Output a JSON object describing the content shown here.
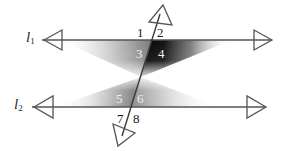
{
  "figure": {
    "background_color": "#ffffff",
    "stroke_color": "#555555",
    "width": 283,
    "height": 151
  },
  "lines": [
    {
      "id": "l1",
      "label": "l",
      "subscript": "1",
      "orientation": "horizontal",
      "y": 40,
      "x_start": 42,
      "x_end": 272,
      "arrow_left": true,
      "arrow_right": true
    },
    {
      "id": "l2",
      "label": "l",
      "subscript": "2",
      "orientation": "horizontal",
      "y": 107,
      "x_start": 32,
      "x_end": 266,
      "arrow_left": true,
      "arrow_right": true
    },
    {
      "id": "transversal",
      "label": "",
      "subscript": "",
      "orientation": "oblique",
      "x_top": 160,
      "y_top": 14,
      "x_bottom": 122,
      "y_bottom": 136,
      "arrow_top": true,
      "arrow_bottom": true
    }
  ],
  "intersections": [
    {
      "id": "top",
      "x": 152,
      "y": 40
    },
    {
      "id": "bottom",
      "x": 131,
      "y": 107
    }
  ],
  "angles": [
    {
      "number": "1",
      "x": 139,
      "y": 27,
      "tone": "light",
      "position": "upper-left-of-top-intersection"
    },
    {
      "number": "2",
      "x": 159,
      "y": 27,
      "tone": "light",
      "position": "upper-right-of-top-intersection"
    },
    {
      "number": "3",
      "x": 139,
      "y": 48,
      "tone": "dark",
      "position": "lower-left-of-top-intersection"
    },
    {
      "number": "4",
      "x": 160,
      "y": 48,
      "tone": "dark",
      "position": "lower-right-of-top-intersection"
    },
    {
      "number": "5",
      "x": 118,
      "y": 93,
      "tone": "dark",
      "position": "upper-left-of-bottom-intersection"
    },
    {
      "number": "6",
      "x": 139,
      "y": 93,
      "tone": "dark",
      "position": "upper-right-of-bottom-intersection"
    },
    {
      "number": "7",
      "x": 119,
      "y": 113,
      "tone": "light",
      "position": "lower-left-of-bottom-intersection"
    },
    {
      "number": "8",
      "x": 135,
      "y": 113,
      "tone": "light",
      "position": "lower-right-of-bottom-intersection"
    }
  ],
  "shading": {
    "description": "Hourglass / bowtie gradient shading between the two lines, darkest in the angle-4 region and fading toward the pinch point",
    "pinch_point": {
      "x": 141,
      "y": 77
    },
    "dark_color": "#000000",
    "mid_color": "#8a8a8a",
    "light_color": "#ffffff"
  }
}
